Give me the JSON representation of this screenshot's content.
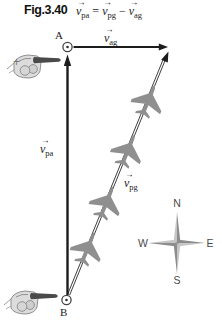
{
  "figure_label": "Fig.3.40",
  "equation": {
    "v": "v",
    "arrow": "→",
    "equals": "=",
    "minus": "−",
    "lhs_sub": "pa",
    "rhs1_sub": "pg",
    "rhs2_sub": "ag"
  },
  "labels": {
    "point_a": "A",
    "point_b": "B",
    "v_pa_sub": "pa",
    "v_pg_sub": "pg",
    "v_ag_sub": "ag",
    "plus": "+"
  },
  "compass": {
    "north": "N",
    "east": "E",
    "south": "S",
    "west": "W"
  },
  "diagram": {
    "airplane_count": 4,
    "vector_vpa_direction": "north (B to A)",
    "vector_vag_direction": "east (from A)",
    "vector_vpg_direction": "northeast (B to tip of v_ag)"
  },
  "colors": {
    "ink": "#1c1c1c",
    "plane_gray": "#8f8f8f",
    "compass_dark": "#8c8c8c",
    "compass_light": "#c6c6c6",
    "hand_fill": "#dcdcdc",
    "hand_outline": "#8f8f8f",
    "finger_dark": "#4a4a4a"
  }
}
